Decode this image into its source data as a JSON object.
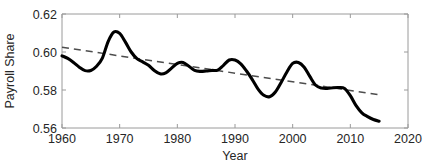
{
  "chart_data": {
    "type": "line",
    "title": "",
    "xlabel": "Year",
    "ylabel": "Payroll Share",
    "xlim": [
      1960,
      2020
    ],
    "ylim": [
      0.56,
      0.62
    ],
    "grid": false,
    "legend": "none",
    "xticks": [
      "1960",
      "1970",
      "1980",
      "1990",
      "2000",
      "2010",
      "2020"
    ],
    "xtick_values": [
      1960,
      1970,
      1980,
      1990,
      2000,
      2010,
      2020
    ],
    "yticks": [
      "0.62",
      "0.60",
      "0.58",
      "0.56"
    ],
    "ytick_values": [
      0.62,
      0.6,
      0.58,
      0.56
    ],
    "series": [
      {
        "name": "Payroll Share",
        "style": "solid",
        "color": "#000000",
        "x": [
          1960,
          1961,
          1962,
          1963,
          1964,
          1965,
          1966,
          1967,
          1968,
          1969,
          1970,
          1971,
          1972,
          1973,
          1974,
          1975,
          1976,
          1977,
          1978,
          1979,
          1980,
          1981,
          1982,
          1983,
          1984,
          1985,
          1986,
          1987,
          1988,
          1989,
          1990,
          1991,
          1992,
          1993,
          1994,
          1995,
          1996,
          1997,
          1998,
          1999,
          2000,
          2001,
          2002,
          2003,
          2004,
          2005,
          2006,
          2007,
          2008,
          2009,
          2010,
          2011,
          2012,
          2013,
          2014,
          2015
        ],
        "values": [
          0.598,
          0.5966,
          0.5945,
          0.592,
          0.5902,
          0.5903,
          0.5925,
          0.5968,
          0.6055,
          0.6105,
          0.6098,
          0.6052,
          0.6,
          0.5965,
          0.5948,
          0.593,
          0.5903,
          0.5885,
          0.589,
          0.5915,
          0.594,
          0.5945,
          0.5925,
          0.5903,
          0.5898,
          0.59,
          0.5903,
          0.5905,
          0.593,
          0.5958,
          0.5958,
          0.5938,
          0.59,
          0.5855,
          0.5805,
          0.5772,
          0.5765,
          0.579,
          0.584,
          0.5895,
          0.594,
          0.5945,
          0.592,
          0.587,
          0.5825,
          0.581,
          0.5808,
          0.5812,
          0.5813,
          0.5808,
          0.577,
          0.5718,
          0.568,
          0.566,
          0.5645,
          0.5636
        ]
      },
      {
        "name": "Linear trend",
        "style": "dashed",
        "color": "#4d4d4d",
        "x": [
          1960,
          2015
        ],
        "values": [
          0.6025,
          0.5775
        ]
      }
    ]
  }
}
